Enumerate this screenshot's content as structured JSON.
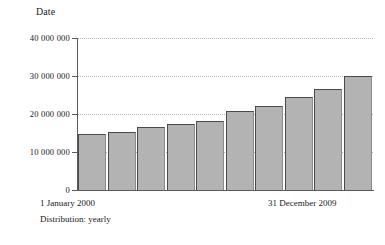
{
  "chart_data": {
    "type": "bar",
    "title": "Date",
    "xlabel": "",
    "ylabel": "",
    "categories": [
      "2000",
      "2001",
      "2002",
      "2003",
      "2004",
      "2005",
      "2006",
      "2007",
      "2008",
      "2009"
    ],
    "values": [
      14700000,
      15300000,
      16600000,
      17400000,
      18200000,
      20800000,
      22100000,
      24500000,
      26600000,
      30000000
    ],
    "ylim": [
      0,
      40000000
    ],
    "yticks": [
      0,
      10000000,
      20000000,
      30000000,
      40000000
    ],
    "ytick_labels": [
      "0",
      "10 000 000",
      "20 000 000",
      "30 000 000",
      "40 000 000"
    ],
    "grid": true,
    "legend": false,
    "bar_color": "#b3b3b3",
    "bar_edge_color": "#4a4a4a",
    "axis_color": "#5a5a5a",
    "grid_color": "#b9b9b9"
  },
  "axis": {
    "range_start_label": "1 January 2000",
    "range_end_label": "31 December 2009"
  },
  "footer": {
    "distribution_label": "Distribution: yearly"
  }
}
